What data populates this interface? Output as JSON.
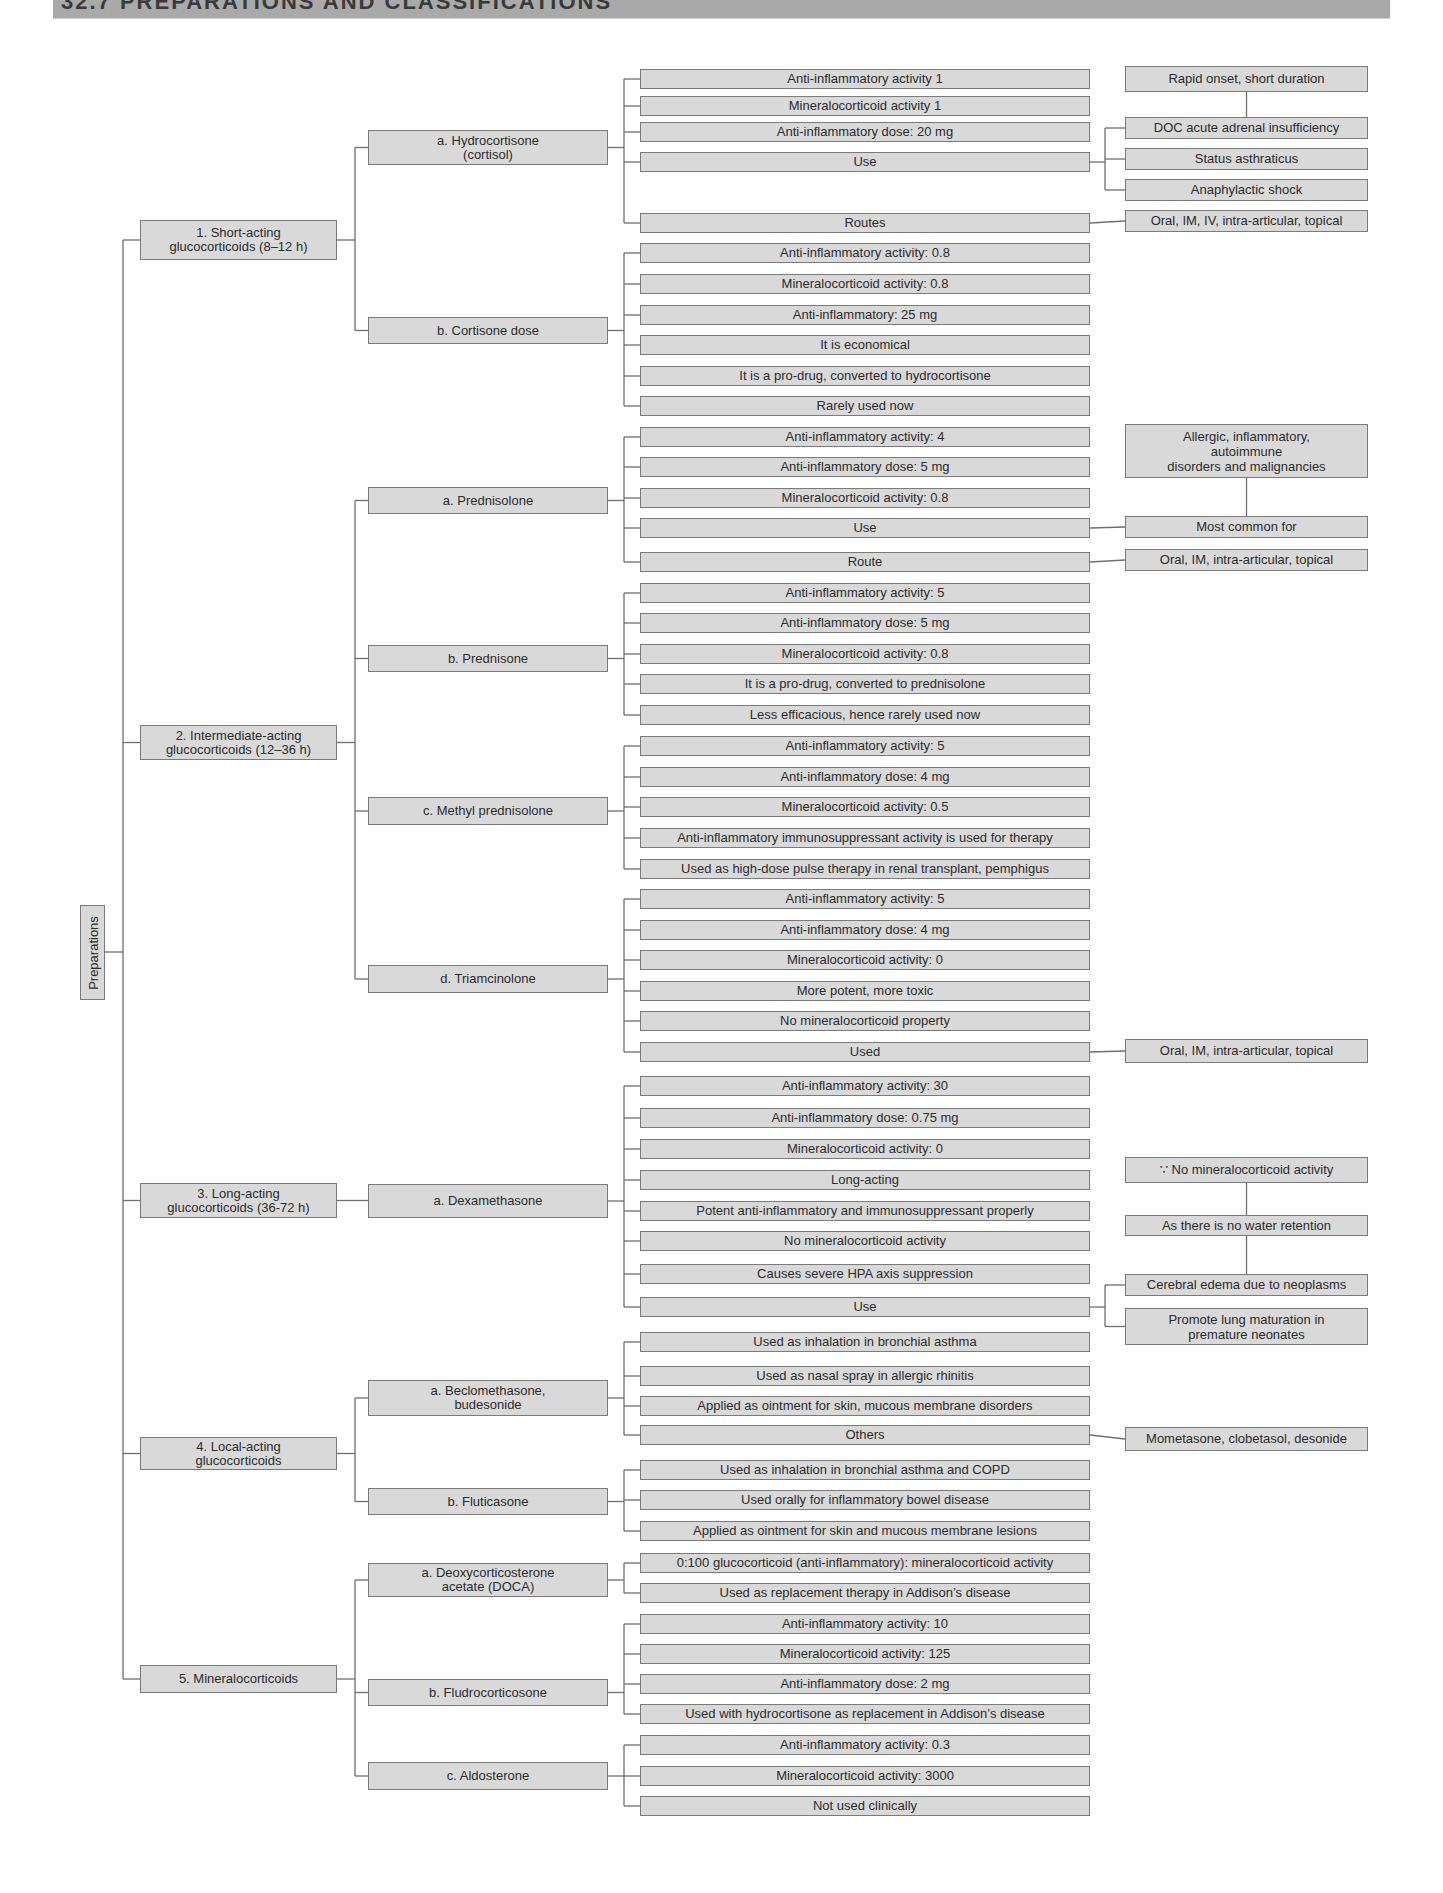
{
  "header": {
    "title": "32.7 PREPARATIONS AND CLASSIFICATIONS"
  },
  "root": {
    "label": "Preparations"
  },
  "groups": [
    {
      "label": "1. Short-acting\nglucocorticoids (8–12 h)",
      "drugs": [
        {
          "label": "a. Hydrocortisone\n(cortisol)",
          "props": [
            "Anti-inflammatory activity 1",
            "Mineralocorticoid activity 1",
            "Anti-inflammatory dose: 20 mg",
            "Use",
            "Routes"
          ]
        },
        {
          "label": "b. Cortisone dose",
          "props": [
            "Anti-inflammatory activity: 0.8",
            "Mineralocorticoid activity: 0.8",
            "Anti-inflammatory: 25 mg",
            "It is economical",
            "It is a pro-drug, converted to hydrocortisone",
            "Rarely used now"
          ]
        }
      ]
    },
    {
      "label": "2. Intermediate-acting\nglucocorticoids (12–36 h)",
      "drugs": [
        {
          "label": "a. Prednisolone",
          "props": [
            "Anti-inflammatory activity: 4",
            "Anti-inflammatory dose: 5 mg",
            "Mineralocorticoid activity: 0.8",
            "Use",
            "Route"
          ]
        },
        {
          "label": "b. Prednisone",
          "props": [
            "Anti-inflammatory activity: 5",
            "Anti-inflammatory dose: 5 mg",
            "Mineralocorticoid activity: 0.8",
            "It is a pro-drug, converted to prednisolone",
            "Less efficacious, hence rarely used now"
          ]
        },
        {
          "label": "c. Methyl prednisolone",
          "props": [
            "Anti-inflammatory activity: 5",
            "Anti-inflammatory dose: 4 mg",
            "Mineralocorticoid activity: 0.5",
            "Anti-inflammatory immunosuppressant activity is used for therapy",
            "Used as high-dose pulse therapy in renal transplant, pemphigus"
          ]
        },
        {
          "label": "d. Triamcinolone",
          "props": [
            "Anti-inflammatory activity: 5",
            "Anti-inflammatory dose: 4 mg",
            "Mineralocorticoid activity: 0",
            "More potent, more toxic",
            "No mineralocorticoid property",
            "Used"
          ]
        }
      ]
    },
    {
      "label": "3. Long-acting\nglucocorticoids (36-72 h)",
      "drugs": [
        {
          "label": "a. Dexamethasone",
          "props": [
            "Anti-inflammatory activity: 30",
            "Anti-inflammatory dose: 0.75 mg",
            "Mineralocorticoid activity: 0",
            "Long-acting",
            "Potent anti-inflammatory and immunosuppressant properly",
            "No mineralocorticoid activity",
            "Causes severe HPA axis suppression",
            "Use"
          ]
        }
      ]
    },
    {
      "label": "4. Local-acting\nglucocorticoids",
      "drugs": [
        {
          "label": "a. Beclomethasone,\nbudesonide",
          "props": [
            "Used as inhalation in bronchial asthma",
            "Used as nasal spray in allergic rhinitis",
            "Applied as ointment for skin, mucous membrane disorders",
            "Others"
          ]
        },
        {
          "label": "b. Fluticasone",
          "props": [
            "Used as inhalation in bronchial asthma and COPD",
            "Used orally for inflammatory bowel disease",
            "Applied as ointment for skin and mucous membrane lesions"
          ]
        }
      ]
    },
    {
      "label": "5. Mineralocorticoids",
      "drugs": [
        {
          "label": "a. Deoxycorticosterone\nacetate (DOCA)",
          "props": [
            "0:100 glucocorticoid (anti-inflammatory):  mineralocorticoid activity",
            "Used as replacement therapy in Addison’s disease"
          ]
        },
        {
          "label": "b. Fludrocorticosone",
          "props": [
            "Anti-inflammatory activity: 10",
            "Mineralocorticoid activity: 125",
            "Anti-inflammatory dose: 2 mg",
            "Used with hydrocortisone as  replacement in Addison’s disease"
          ]
        },
        {
          "label": "c. Aldosterone",
          "props": [
            "Anti-inflammatory activity: 0.3",
            "Mineralocorticoid activity: 3000",
            "Not used clinically"
          ]
        }
      ]
    }
  ],
  "notes": {
    "hydro_use_header": "Rapid onset, short duration",
    "hydro_use_items": [
      "DOC acute adrenal insufficiency",
      "Status asthraticus",
      "Anaphylactic shock"
    ],
    "hydro_routes": "Oral, IM, IV, intra-articular, topical",
    "pred_use_header": "Allergic, inflammatory,\nautoimmune\ndisorders and malignancies",
    "pred_use": "Most common for",
    "pred_route": "Oral, IM, intra-articular, topical",
    "triam_used": "Oral, IM, intra-articular, topical",
    "dexa_reason_1": "∵ No mineralocorticoid activity",
    "dexa_reason_2": "As there is no water retention",
    "dexa_use_items": [
      "Cerebral edema due to neoplasms",
      "Promote lung maturation in\npremature  neonates"
    ],
    "beclo_others": "Mometasone, clobetasol, desonide"
  }
}
